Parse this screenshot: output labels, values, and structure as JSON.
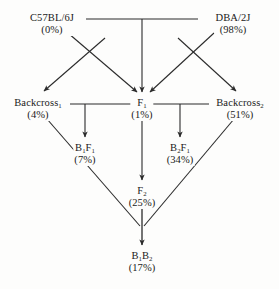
{
  "diagram": {
    "type": "pedigree-flow",
    "background_color": "#fdfdfc",
    "line_color": "#2b2b2b",
    "text_color": "#1a1a1a",
    "nodes": [
      {
        "id": "c57bl6j",
        "name": "C57BL/6J",
        "name_base": "C57BL/6J",
        "subscript": "",
        "percent": "(0%)",
        "x": 52,
        "y": 14
      },
      {
        "id": "dba2j",
        "name": "DBA/2J",
        "name_base": "DBA/2J",
        "subscript": "",
        "percent": "(98%)",
        "x": 233,
        "y": 14
      },
      {
        "id": "backcross1",
        "name": "Backcross1",
        "name_base": "Backcross",
        "subscript": "1",
        "percent": "(4%)",
        "x": 38,
        "y": 100
      },
      {
        "id": "f1",
        "name": "F1",
        "name_base": "F",
        "subscript": "1",
        "percent": "(1%)",
        "x": 142,
        "y": 100
      },
      {
        "id": "backcross2",
        "name": "Backcross2",
        "name_base": "Backcross",
        "subscript": "2",
        "percent": "(51%)",
        "x": 240,
        "y": 100
      },
      {
        "id": "b1f1",
        "name": "B1F1",
        "name_base": "B",
        "subscript": "1",
        "name_base2": "F",
        "subscript2": "1",
        "percent": "(7%)",
        "x": 85,
        "y": 145
      },
      {
        "id": "b2f1",
        "name": "B2F1",
        "name_base": "B",
        "subscript": "2",
        "name_base2": "F",
        "subscript2": "1",
        "percent": "(34%)",
        "x": 180,
        "y": 145
      },
      {
        "id": "f2",
        "name": "F2",
        "name_base": "F",
        "subscript": "2",
        "percent": "(25%)",
        "x": 142,
        "y": 188
      },
      {
        "id": "b1b2",
        "name": "B1B2",
        "name_base": "B",
        "subscript": "1",
        "name_base2": "B",
        "subscript2": "2",
        "percent": "(17%)",
        "x": 142,
        "y": 253
      }
    ],
    "labels": {
      "c57bl6j_name": "C57BL/6J",
      "c57bl6j_percent": "(0%)",
      "dba2j_name": "DBA/2J",
      "dba2j_percent": "(98%)",
      "backcross1_name": "Backcross",
      "backcross1_sub": "1",
      "backcross1_percent": "(4%)",
      "f1_name": "F",
      "f1_sub": "1",
      "f1_percent": "(1%)",
      "backcross2_name": "Backcross",
      "backcross2_sub": "2",
      "backcross2_percent": "(51%)",
      "b1f1_b": "B",
      "b1f1_bsub": "1",
      "b1f1_f": "F",
      "b1f1_fsub": "1",
      "b1f1_percent": "(7%)",
      "b2f1_b": "B",
      "b2f1_bsub": "2",
      "b2f1_f": "F",
      "b2f1_fsub": "1",
      "b2f1_percent": "(34%)",
      "f2_name": "F",
      "f2_sub": "2",
      "f2_percent": "(25%)",
      "b1b2_b1": "B",
      "b1b2_b1sub": "1",
      "b1b2_b2": "B",
      "b1b2_b2sub": "2",
      "b1b2_percent": "(17%)"
    }
  }
}
